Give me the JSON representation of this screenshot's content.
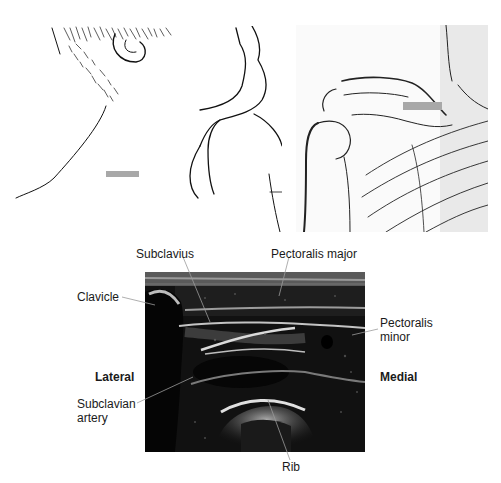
{
  "figure": {
    "top_caption_cut": "",
    "panels": {
      "left_photo": {
        "description": "Line drawing of patient's neck and shoulder, side view",
        "marker_color": "#a8a8a8"
      },
      "right_photo": {
        "description": "Line drawing of shoulder skeleton (clavicle, scapula, ribs)",
        "marker_color": "#a8a8a8"
      },
      "ultrasound": {
        "description": "Ultrasound image of infraclavicular region"
      }
    },
    "labels": {
      "subclavius": "Subclavius",
      "pectoralis_major": "Pectoralis major",
      "clavicle": "Clavicle",
      "pectoralis_minor_line1": "Pectoralis",
      "pectoralis_minor_line2": "minor",
      "lateral": "Lateral",
      "medial": "Medial",
      "subclavian_artery_line1": "Subclavian",
      "subclavian_artery_line2": "artery",
      "rib": "Rib"
    }
  }
}
